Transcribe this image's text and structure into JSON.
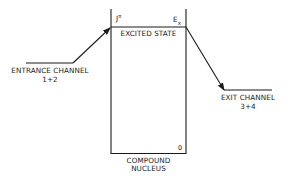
{
  "diagram": {
    "entrance_channel": {
      "label": "ENTRANCE  CHANNEL",
      "sub": "1+2"
    },
    "exit_channel": {
      "label": "EXIT  CHANNEL",
      "sub": "3+4"
    },
    "excited_state": {
      "label": "EXCITED STATE",
      "spin_parity": "J",
      "spin_parity_sup": "π",
      "energy": "E",
      "energy_sub": "x"
    },
    "compound_nucleus": {
      "label_line1": "COMPOUND",
      "label_line2": "NUCLEUS",
      "ground_level": "0"
    },
    "colors": {
      "ink": "#1a1a1a",
      "background": "#ffffff"
    }
  }
}
